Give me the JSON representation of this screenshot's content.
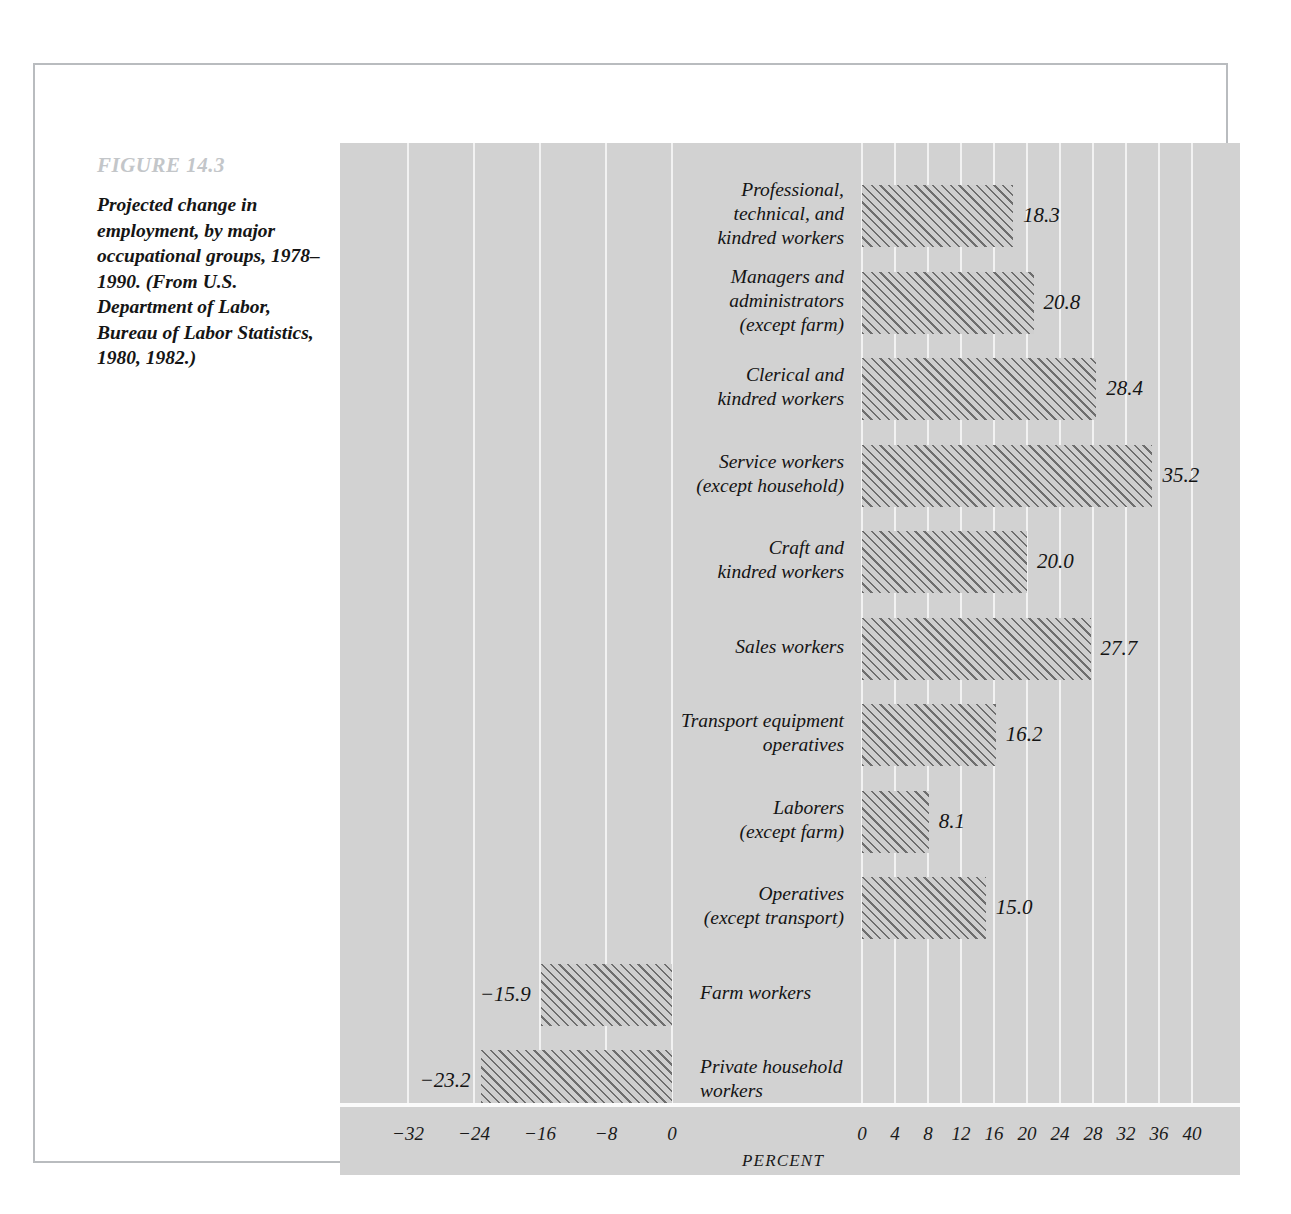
{
  "figure": {
    "label": "FIGURE 14.3",
    "caption": "Projected change in employment, by major occupational groups, 1978–1990. (From U.S. Department of Labor, Bureau of Labor Statistics, 1980, 1982.)"
  },
  "chart_data": {
    "type": "bar",
    "orientation": "horizontal",
    "title": "Projected change in employment, by major occupational groups, 1978–1990.",
    "xlabel": "PERCENT",
    "ylabel": "",
    "grid": true,
    "legend": null,
    "axis_left_ticks": [
      "−32",
      "−24",
      "−16",
      "−8",
      "0"
    ],
    "axis_left_values": [
      -32,
      -24,
      -16,
      -8,
      0
    ],
    "axis_right_ticks": [
      "0",
      "4",
      "8",
      "12",
      "16",
      "20",
      "24",
      "28",
      "32",
      "36",
      "40"
    ],
    "axis_right_values": [
      0,
      4,
      8,
      12,
      16,
      20,
      24,
      28,
      32,
      36,
      40
    ],
    "xlim": [
      -36,
      42
    ],
    "categories": [
      "Professional,\ntechnical, and\nkindred workers",
      "Managers and\nadministrators\n(except farm)",
      "Clerical and\nkindred workers",
      "Service workers\n(except household)",
      "Craft and\nkindred workers",
      "Sales workers",
      "Transport equipment\noperatives",
      "Laborers\n(except farm)",
      "Operatives\n(except transport)",
      "Farm workers",
      "Private household\nworkers"
    ],
    "values": [
      18.3,
      20.8,
      28.4,
      35.2,
      20.0,
      27.7,
      16.2,
      8.1,
      15.0,
      -15.9,
      -23.2
    ],
    "value_labels": [
      "18.3",
      "20.8",
      "28.4",
      "35.2",
      "20.0",
      "27.7",
      "16.2",
      "8.1",
      "15.0",
      "−15.9",
      "−23.2"
    ]
  },
  "colors": {
    "panel_background": "#d2d2d2",
    "gridline": "#f2f2f2",
    "bar_hatch": "#6e6e6e",
    "bar_fill": "#cfcfcf",
    "text": "#141414",
    "figure_label": "#c3c6c9",
    "frame_border": "#b9bcbf"
  }
}
